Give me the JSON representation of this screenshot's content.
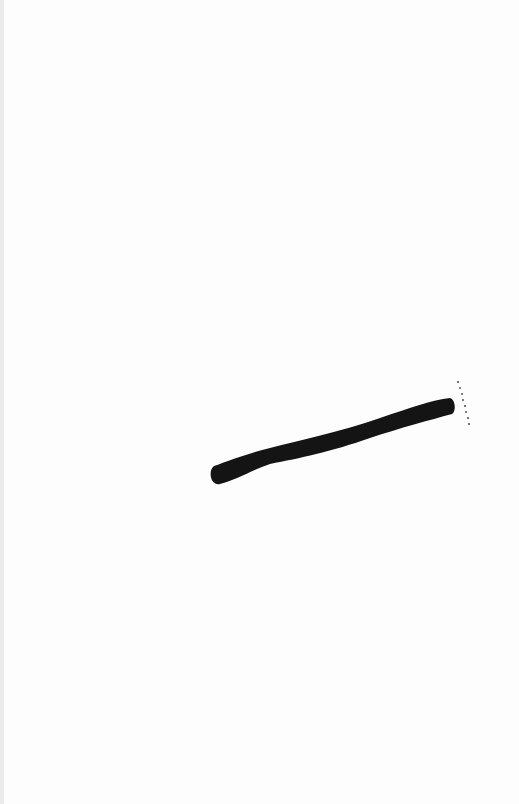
{
  "image": {
    "description": "Scanned white paper with a single diagonal black brush stroke and a small dotted mark",
    "background_color": "#fdfdfd",
    "edge_color": "#ececec",
    "stroke_color": "#141414",
    "stroke": {
      "start": [
        214,
        477
      ],
      "end": [
        452,
        404
      ]
    },
    "dotted_mark": {
      "start": [
        458,
        382
      ],
      "end": [
        469,
        424
      ]
    }
  }
}
